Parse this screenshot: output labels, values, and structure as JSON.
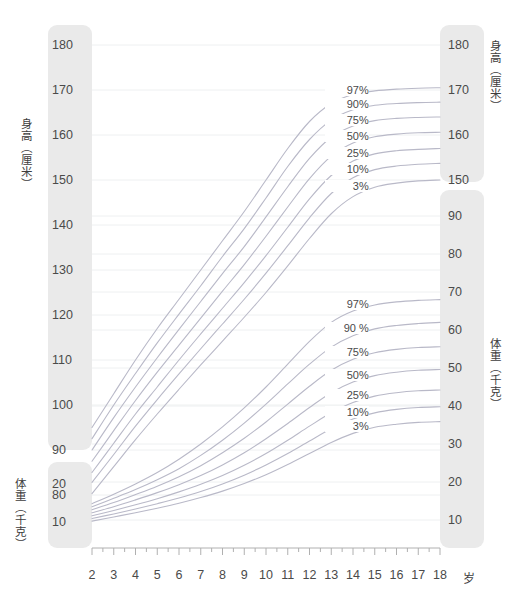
{
  "chart_data": {
    "type": "line",
    "title": "",
    "xlabel": "岁",
    "grid": true,
    "legend_position": "inline-right",
    "x": [
      2,
      3,
      4,
      5,
      6,
      7,
      8,
      9,
      10,
      11,
      12,
      13,
      14,
      15,
      16,
      17,
      18
    ],
    "x_ticks": [
      "2",
      "3",
      "4",
      "5",
      "6",
      "7",
      "8",
      "9",
      "10",
      "11",
      "12",
      "13",
      "14",
      "15",
      "16",
      "17",
      "18"
    ],
    "x_unit": "岁",
    "xlim": [
      2,
      18
    ],
    "panels": [
      {
        "name": "height",
        "axis_title_left": "身高（厘米）",
        "axis_title_right": "身高（厘米）",
        "ylabel": "身高（厘米）",
        "unit": "厘米",
        "ylim": [
          70,
          185
        ],
        "y_ticks_left": [
          "180",
          "170",
          "160",
          "150",
          "140",
          "130",
          "120",
          "110",
          "100",
          "90",
          "80"
        ],
        "y_ticks_right": [
          "180",
          "170",
          "160",
          "150"
        ],
        "series": [
          {
            "name": "97%",
            "label": "97%",
            "values": [
              95.0,
              102.5,
              110.0,
              117.0,
              123.5,
              130.0,
              136.5,
              143.0,
              150.0,
              157.0,
              163.0,
              167.0,
              169.0,
              169.8,
              170.2,
              170.4,
              170.5
            ]
          },
          {
            "name": "90%",
            "label": "90%",
            "values": [
              92.5,
              100.0,
              107.0,
              113.8,
              120.2,
              126.5,
              133.0,
              139.2,
              146.0,
              153.0,
              159.0,
              163.3,
              165.6,
              166.6,
              167.0,
              167.2,
              167.3
            ]
          },
          {
            "name": "75%",
            "label": "75%",
            "values": [
              90.0,
              97.2,
              104.0,
              110.5,
              116.8,
              123.0,
              129.2,
              135.2,
              141.8,
              148.5,
              154.8,
              159.5,
              162.0,
              163.2,
              163.7,
              163.9,
              164.0
            ]
          },
          {
            "name": "50%",
            "label": "50%",
            "values": [
              87.5,
              94.3,
              101.0,
              107.3,
              113.3,
              119.3,
              125.3,
              131.2,
              137.5,
              144.0,
              150.3,
              155.3,
              158.2,
              159.6,
              160.2,
              160.5,
              160.6
            ]
          },
          {
            "name": "25%",
            "label": "25%",
            "values": [
              85.0,
              91.5,
              98.0,
              104.0,
              110.0,
              115.8,
              121.5,
              127.2,
              133.2,
              139.5,
              145.8,
              151.0,
              154.2,
              155.8,
              156.5,
              156.8,
              157.0
            ]
          },
          {
            "name": "10%",
            "label": "10%",
            "values": [
              82.8,
              89.0,
              95.3,
              101.2,
              106.9,
              112.5,
              118.0,
              123.5,
              129.3,
              135.4,
              141.6,
              147.0,
              150.5,
              152.3,
              153.1,
              153.5,
              153.7
            ]
          },
          {
            "name": "3%",
            "label": "3%",
            "values": [
              80.3,
              86.3,
              92.3,
              98.0,
              103.5,
              108.9,
              114.2,
              119.5,
              125.0,
              130.9,
              137.0,
              142.5,
              146.3,
              148.4,
              149.3,
              149.8,
              150.0
            ]
          }
        ]
      },
      {
        "name": "weight",
        "axis_title_left": "体重（千克）",
        "axis_title_right": "体重（千克）",
        "ylabel": "体重（千克）",
        "unit": "千克",
        "ylim": [
          5,
          95
        ],
        "y_ticks_left": [
          "20",
          "10"
        ],
        "y_ticks_right": [
          "90",
          "80",
          "70",
          "60",
          "50",
          "40",
          "30",
          "20",
          "10"
        ],
        "series": [
          {
            "name": "97%",
            "label": "97%",
            "values": [
              14.3,
              16.8,
              19.5,
              22.5,
              26.0,
              30.0,
              34.5,
              39.5,
              45.0,
              51.0,
              57.0,
              62.0,
              65.0,
              66.6,
              67.4,
              67.8,
              68.0
            ]
          },
          {
            "name": "90 %",
            "label": "90 %",
            "values": [
              13.5,
              15.7,
              18.0,
              20.6,
              23.5,
              27.0,
              31.0,
              35.5,
              40.5,
              45.8,
              51.0,
              55.5,
              58.5,
              60.3,
              61.2,
              61.7,
              62.0
            ]
          },
          {
            "name": "75%",
            "label": "75%",
            "values": [
              12.7,
              14.6,
              16.7,
              18.9,
              21.4,
              24.3,
              27.7,
              31.5,
              35.8,
              40.5,
              45.2,
              49.4,
              52.3,
              54.0,
              54.9,
              55.4,
              55.6
            ]
          },
          {
            "name": "50%",
            "label": "50%",
            "values": [
              11.9,
              13.5,
              15.3,
              17.2,
              19.3,
              21.7,
              24.5,
              27.7,
              31.4,
              35.4,
              39.6,
              43.5,
              46.3,
              48.0,
              48.9,
              49.4,
              49.6
            ]
          },
          {
            "name": "25%",
            "label": "25%",
            "values": [
              11.1,
              12.5,
              14.0,
              15.6,
              17.4,
              19.4,
              21.7,
              24.4,
              27.5,
              31.0,
              34.7,
              38.2,
              40.9,
              42.6,
              43.5,
              44.0,
              44.2
            ]
          },
          {
            "name": "10%",
            "label": "10%",
            "values": [
              10.4,
              11.6,
              12.9,
              14.3,
              15.8,
              17.5,
              19.5,
              21.8,
              24.5,
              27.5,
              30.8,
              34.0,
              36.6,
              38.2,
              39.1,
              39.6,
              39.8
            ]
          },
          {
            "name": "3%",
            "label": "3%",
            "values": [
              9.7,
              10.8,
              11.9,
              13.1,
              14.4,
              15.9,
              17.6,
              19.6,
              21.9,
              24.6,
              27.5,
              30.4,
              32.8,
              34.4,
              35.2,
              35.7,
              35.9
            ]
          }
        ]
      }
    ]
  },
  "colors": {
    "curve": "#b9b9c8",
    "grid": "#eef0f1",
    "axis_box": "#eaeaea",
    "text": "#4a4a4a",
    "axis_line": "#b0b0b0"
  },
  "axes": {
    "left_height_ticks": [
      {
        "label": "180",
        "top": 39
      },
      {
        "label": "170",
        "top": 84
      },
      {
        "label": "160",
        "top": 129
      },
      {
        "label": "150",
        "top": 174
      },
      {
        "label": "140",
        "top": 219
      },
      {
        "label": "130",
        "top": 264
      },
      {
        "label": "120",
        "top": 309
      },
      {
        "label": "110",
        "top": 354
      },
      {
        "label": "100",
        "top": 399
      },
      {
        "label": "90",
        "top": 444
      },
      {
        "label": "80",
        "top": 489
      }
    ],
    "left_weight_ticks": [
      {
        "label": "20",
        "top": 478
      },
      {
        "label": "10",
        "top": 516
      }
    ],
    "right_height_ticks": [
      {
        "label": "180",
        "top": 39
      },
      {
        "label": "170",
        "top": 84
      },
      {
        "label": "160",
        "top": 129
      },
      {
        "label": "150",
        "top": 174
      }
    ],
    "right_weight_ticks": [
      {
        "label": "90",
        "top": 210
      },
      {
        "label": "80",
        "top": 248
      },
      {
        "label": "70",
        "top": 286
      },
      {
        "label": "60",
        "top": 324
      },
      {
        "label": "50",
        "top": 362
      },
      {
        "label": "40",
        "top": 400
      },
      {
        "label": "30",
        "top": 438
      },
      {
        "label": "20",
        "top": 476
      },
      {
        "label": "10",
        "top": 514
      }
    ]
  },
  "titles": {
    "left_height": "身高（厘米）",
    "left_weight": "体重（千克）",
    "right_height": "身高（厘米）",
    "right_weight": "体重（千克）"
  }
}
